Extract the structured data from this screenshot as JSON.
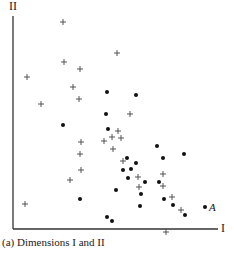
{
  "chart_data": {
    "type": "scatter",
    "title": "",
    "caption": "(a) Dimensions I and II",
    "xlabel": "I",
    "ylabel": "II",
    "grid": false,
    "legend": null,
    "pixel_frame": {
      "origin_x": 13,
      "origin_y": 229,
      "x_end": 218,
      "y_top": 16
    },
    "series": [
      {
        "name": "plus",
        "marker": "+",
        "points_px": [
          [
            63,
            22
          ],
          [
            117,
            53
          ],
          [
            64,
            62
          ],
          [
            80,
            69
          ],
          [
            27,
            77
          ],
          [
            73,
            87
          ],
          [
            79,
            99
          ],
          [
            41,
            104
          ],
          [
            130,
            114
          ],
          [
            118,
            131
          ],
          [
            112,
            137
          ],
          [
            121,
            138
          ],
          [
            104,
            141
          ],
          [
            81,
            142
          ],
          [
            113,
            149
          ],
          [
            80,
            154
          ],
          [
            123,
            161
          ],
          [
            81,
            170
          ],
          [
            163,
            174
          ],
          [
            70,
            180
          ],
          [
            138,
            177
          ],
          [
            139,
            187
          ],
          [
            163,
            186
          ],
          [
            172,
            197
          ],
          [
            181,
            210
          ],
          [
            25,
            204
          ],
          [
            166,
            232
          ]
        ]
      },
      {
        "name": "dot",
        "marker": "•",
        "points_px": [
          [
            107,
            92
          ],
          [
            136,
            95
          ],
          [
            106,
            114
          ],
          [
            63,
            125
          ],
          [
            108,
            129
          ],
          [
            157,
            146
          ],
          [
            184,
            154
          ],
          [
            127,
            158
          ],
          [
            163,
            158
          ],
          [
            136,
            163
          ],
          [
            123,
            170
          ],
          [
            131,
            169
          ],
          [
            128,
            178
          ],
          [
            145,
            182
          ],
          [
            159,
            182
          ],
          [
            116,
            190
          ],
          [
            141,
            194
          ],
          [
            164,
            199
          ],
          [
            80,
            199
          ],
          [
            173,
            205
          ],
          [
            140,
            206
          ],
          [
            185,
            215
          ],
          [
            107,
            217
          ],
          [
            112,
            221
          ]
        ]
      }
    ],
    "annotations": [
      {
        "text": "A",
        "point_px": [
          205,
          207
        ],
        "marker": "•"
      }
    ]
  }
}
